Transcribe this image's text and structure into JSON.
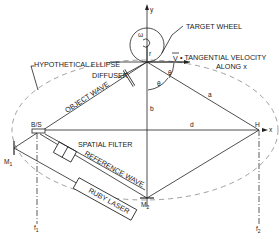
{
  "diagram": {
    "labels": {
      "target_wheel": "TARGET WHEEL",
      "hypothetical_ellipse": "HYPOTHETICAL ELLIPSE",
      "diffuser": "DIFFUSER",
      "tangential_velocity_v": "V",
      "tangential_velocity_line1": "• TANGENTIAL VELOCITY",
      "tangential_velocity_line2": "ALONG x",
      "object_wave": "OBJECT WAVE",
      "spatial_filter": "SPATIAL FILTER",
      "reference_wave": "REFERENCE WAVE",
      "ruby_laser": "RUBY LASER",
      "beam_splitter": "B/S",
      "hologram": "H",
      "mirror1": "M",
      "mirror1_sub": "1",
      "mirror2": "M",
      "mirror2_sub": "2",
      "focal1": "f",
      "focal1_sub": "1",
      "focal2": "f",
      "focal2_sub": "2",
      "y_axis": "y",
      "x_axis": "x",
      "omega": "ω",
      "radius": "r",
      "theta1": "θ",
      "theta2": "θ",
      "a": "a",
      "b": "b",
      "d": "d"
    }
  }
}
